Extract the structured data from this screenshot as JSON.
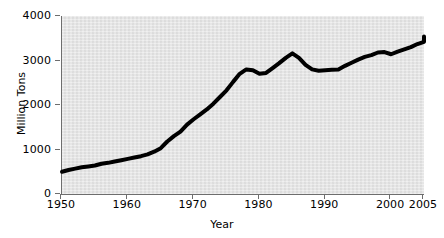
{
  "chart_data": {
    "type": "line",
    "title": "",
    "subtitle": "",
    "xlabel": "Year",
    "ylabel": "Million Tons",
    "xlim": [
      1950,
      2005
    ],
    "ylim": [
      0,
      4000
    ],
    "grid": false,
    "legend": null,
    "xticks": [
      1950,
      1960,
      1970,
      1980,
      1990,
      2000,
      2005
    ],
    "xtick_labels": [
      "1950",
      "1960",
      "1970",
      "1980",
      "1990",
      "2000",
      "2005"
    ],
    "yticks": [
      0,
      1000,
      2000,
      3000,
      4000
    ],
    "ytick_labels": [
      "0",
      "1000",
      "2000",
      "3000",
      "4000"
    ],
    "line_color": "#000000",
    "line_width": 4,
    "plot_background": "#e3e3e3",
    "axis_color": "#6d6d6d",
    "series": [
      {
        "name": "Million Tons",
        "x": [
          1950,
          1951,
          1952,
          1953,
          1954,
          1955,
          1956,
          1957,
          1958,
          1959,
          1960,
          1961,
          1962,
          1963,
          1964,
          1965,
          1966,
          1967,
          1968,
          1969,
          1970,
          1971,
          1972,
          1973,
          1974,
          1975,
          1976,
          1977,
          1978,
          1979,
          1980,
          1981,
          1982,
          1983,
          1984,
          1985,
          1986,
          1987,
          1988,
          1989,
          1990,
          1991,
          1992,
          1993,
          1994,
          1995,
          1996,
          1997,
          1998,
          1999,
          2000,
          2001,
          2002,
          2003,
          2004,
          2005,
          2006,
          2007,
          2008
        ],
        "y": [
          500,
          540,
          570,
          600,
          620,
          640,
          680,
          700,
          730,
          760,
          790,
          820,
          850,
          890,
          950,
          1030,
          1180,
          1300,
          1400,
          1560,
          1680,
          1790,
          1900,
          2030,
          2180,
          2330,
          2520,
          2700,
          2800,
          2780,
          2700,
          2720,
          2830,
          2940,
          3060,
          3160,
          3060,
          2900,
          2800,
          2770,
          2780,
          2790,
          2800,
          2880,
          2950,
          3020,
          3080,
          3120,
          3180,
          3190,
          3140,
          3200,
          3250,
          3300,
          3370,
          3420,
          3480,
          3520,
          3540
        ],
        "units": "million tons"
      }
    ],
    "annotations": []
  },
  "axis": {
    "ylabel": "Million Tons",
    "xlabel": "Year"
  }
}
